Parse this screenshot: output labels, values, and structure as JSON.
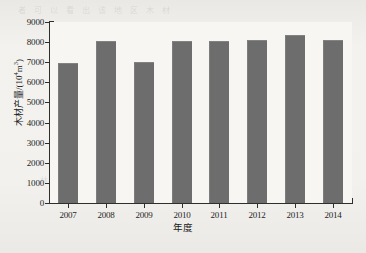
{
  "chart_data": {
    "type": "bar",
    "title": "",
    "subtitle": "",
    "xlabel": "年度",
    "ylabel": "木材产量/(10⁴m³)",
    "ylabel_parts": {
      "prefix": "木材产量/(10",
      "exponent": "4",
      "suffix": "m",
      "unit_exponent": "3",
      "close": ")"
    },
    "categories": [
      "2007",
      "2008",
      "2009",
      "2010",
      "2011",
      "2012",
      "2013",
      "2014"
    ],
    "values": [
      6950,
      8080,
      7000,
      8080,
      8080,
      8100,
      8350,
      8120
    ],
    "series": [
      {
        "name": "木材产量",
        "values": [
          6950,
          8080,
          7000,
          8080,
          8080,
          8100,
          8350,
          8120
        ]
      }
    ],
    "ylim": [
      0,
      9000
    ],
    "ytick_values": [
      0,
      1000,
      2000,
      3000,
      4000,
      5000,
      6000,
      7000,
      8000,
      9000
    ],
    "ytick_labels": [
      "0",
      "1000",
      "2000",
      "3000",
      "4000",
      "5000",
      "6000",
      "7000",
      "8000",
      "9000"
    ],
    "grid": false,
    "legend": false,
    "legend_position": "none",
    "bar_color": "#6d6d6d",
    "plot_background": "#f7f6f3",
    "axis_color": "#2e2e2e"
  },
  "caption": {
    "text": ""
  },
  "ghost_text": {
    "row1": "者 可 以 看 出 该 地 区 木 材",
    "row2": "量 的 变 化 特 征 是",
    "row3": "林 木 蓄 积 量 增 加"
  }
}
